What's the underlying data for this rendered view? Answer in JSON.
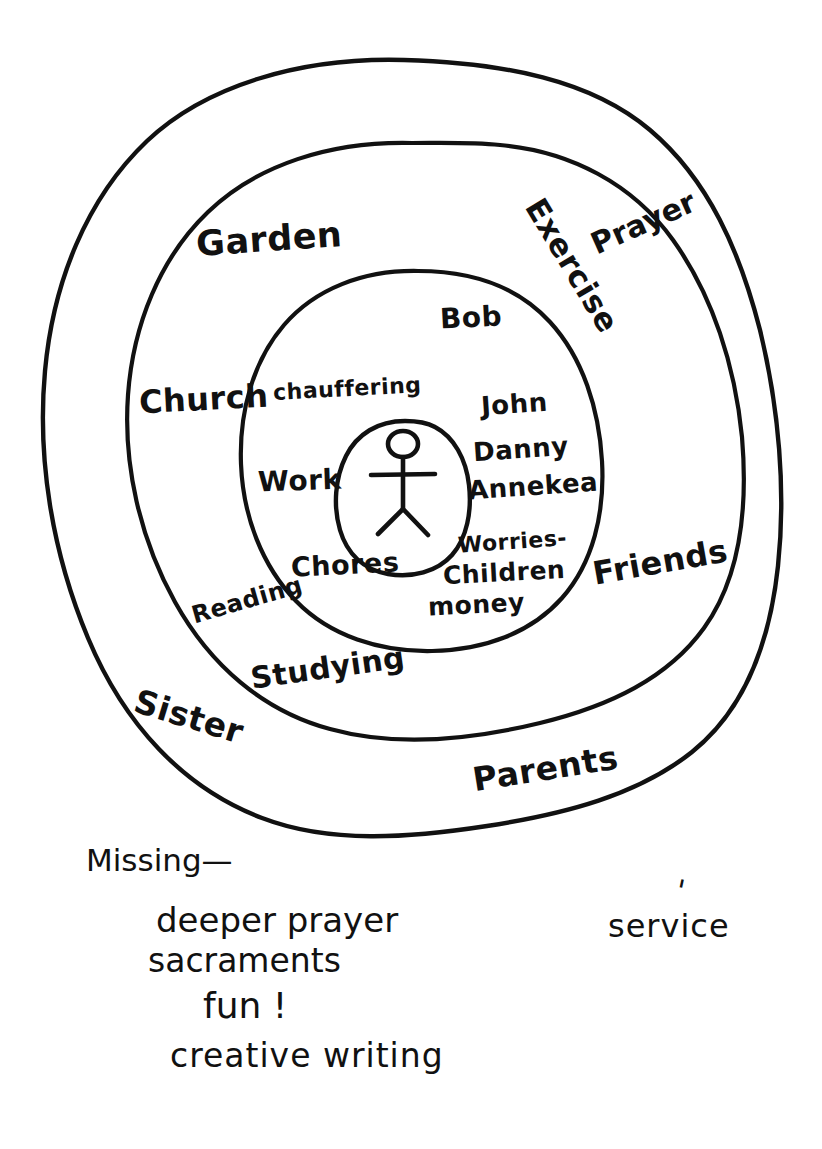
{
  "diagram": {
    "medium": "hand-drawn ink on white paper",
    "ink_color": "#111111",
    "paper_color": "#ffffff",
    "center": {
      "icon": "stick-figure-person",
      "label": "self"
    },
    "rings": [
      {
        "index": 1,
        "name": "inner-ring",
        "items": [
          {
            "key": "bob",
            "label": "Bob"
          },
          {
            "key": "chauffering",
            "label": "chauffering"
          },
          {
            "key": "john",
            "label": "John"
          },
          {
            "key": "danny",
            "label": "Danny"
          },
          {
            "key": "annekea",
            "label": "Annekea"
          },
          {
            "key": "work",
            "label": "Work"
          },
          {
            "key": "chores",
            "label": "Chores"
          },
          {
            "key": "worries",
            "label": "Worries-"
          },
          {
            "key": "children",
            "label": "Children"
          },
          {
            "key": "money",
            "label": "money"
          }
        ]
      },
      {
        "index": 2,
        "name": "middle-ring",
        "items": [
          {
            "key": "garden",
            "label": "Garden"
          },
          {
            "key": "exercise",
            "label": "Exercise"
          },
          {
            "key": "church",
            "label": "Church"
          },
          {
            "key": "reading",
            "label": "Reading"
          },
          {
            "key": "studying",
            "label": "Studying"
          }
        ]
      },
      {
        "index": 3,
        "name": "outer-ring",
        "items": [
          {
            "key": "prayer",
            "label": "Prayer"
          },
          {
            "key": "friends",
            "label": "Friends"
          },
          {
            "key": "parents",
            "label": "Parents"
          },
          {
            "key": "sister",
            "label": "Sister"
          }
        ]
      }
    ]
  },
  "notes": {
    "heading": "Missing—",
    "tick_mark": "'",
    "lines": [
      {
        "key": "deeper-prayer",
        "label": "deeper prayer"
      },
      {
        "key": "service",
        "label": "service"
      },
      {
        "key": "sacraments",
        "label": "sacraments"
      },
      {
        "key": "fun",
        "label": "fun !"
      },
      {
        "key": "creative-writing",
        "label": "creative writing"
      }
    ]
  }
}
